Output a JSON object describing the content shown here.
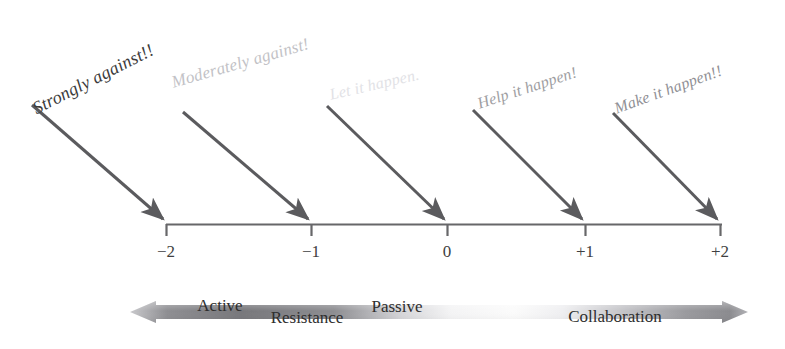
{
  "figure": {
    "type": "annotated-number-line-diagram",
    "background_color": "#ffffff",
    "line_color": "#595959",
    "axis": {
      "y": 224,
      "x_start": 166,
      "x_end": 722,
      "tick_labels": [
        "−2",
        "−1",
        "0",
        "+1",
        "+2"
      ],
      "tick_x": [
        166,
        311,
        447,
        585,
        720
      ]
    },
    "stance_labels": [
      {
        "text": "Strongly against!!",
        "x": 34,
        "y": 99,
        "rotation": -27,
        "color": "#3b3b3b",
        "opacity": 1.0
      },
      {
        "text": "Moderately against!",
        "x": 172,
        "y": 73,
        "rotation": -16,
        "color": "#b9b9bd",
        "opacity": 0.75
      },
      {
        "text": "Let it happen.",
        "x": 330,
        "y": 86,
        "rotation": -13,
        "color": "#dedee2",
        "opacity": 0.6
      },
      {
        "text": "Help it happen!",
        "x": 478,
        "y": 95,
        "rotation": -18,
        "color": "#9a9a9e",
        "opacity": 0.9
      },
      {
        "text": "Make it happen!!",
        "x": 615,
        "y": 100,
        "rotation": -20,
        "color": "#8d8d92",
        "opacity": 0.9
      }
    ],
    "arrows": [
      {
        "x1": 32,
        "y1": 105,
        "x2": 166,
        "y2": 221
      },
      {
        "x1": 183,
        "y1": 112,
        "x2": 311,
        "y2": 221
      },
      {
        "x1": 327,
        "y1": 106,
        "x2": 447,
        "y2": 221
      },
      {
        "x1": 473,
        "y1": 110,
        "x2": 585,
        "y2": 221
      },
      {
        "x1": 613,
        "y1": 113,
        "x2": 720,
        "y2": 221
      }
    ],
    "spectrum_band": {
      "left_tip_x": 130,
      "right_tip_x": 748,
      "center_y": 312,
      "half_height": 11,
      "head_length": 26,
      "fill_dark": "#6f6f72",
      "fill_light": "#f3f3f4"
    },
    "band_labels": [
      {
        "text": "Active",
        "x": 220,
        "y": 306,
        "faded": false
      },
      {
        "text": "Resistance",
        "x": 307,
        "y": 318,
        "faded": false
      },
      {
        "text": "Passive",
        "x": 397,
        "y": 307,
        "faded": false
      },
      {
        "text": "Collaboration",
        "x": 615,
        "y": 317,
        "faded": false
      }
    ]
  }
}
